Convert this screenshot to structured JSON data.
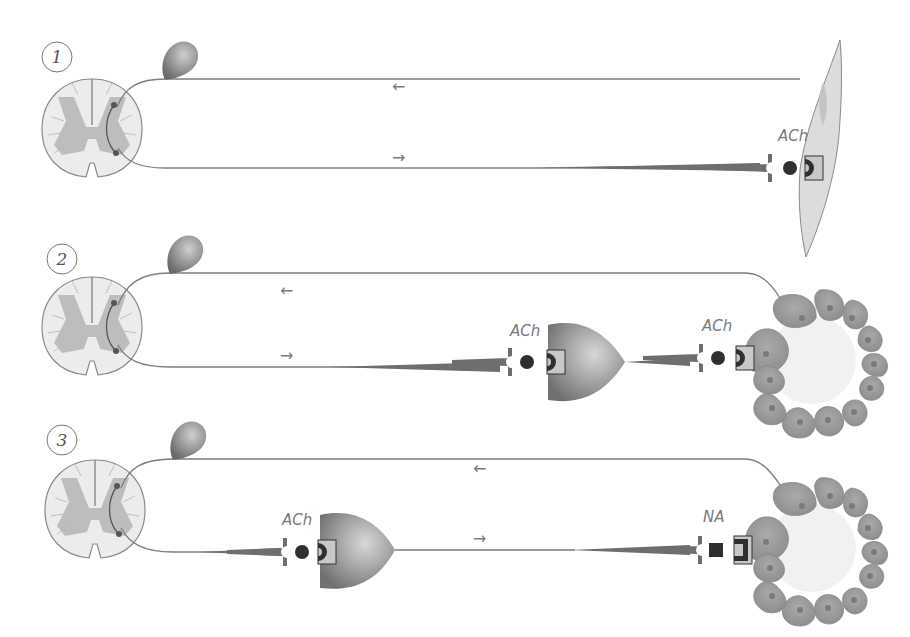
{
  "figure": {
    "panels": [
      {
        "number": "1",
        "afferent_arrow": "←",
        "efferent_arrow": "→",
        "synapses": [
          {
            "transmitter": "ACh",
            "vesicle": "circle"
          }
        ],
        "target": "skeletal-muscle-fiber"
      },
      {
        "number": "2",
        "afferent_arrow": "←",
        "efferent_arrow": "→",
        "synapses": [
          {
            "transmitter": "ACh",
            "vesicle": "circle",
            "location": "ganglion"
          },
          {
            "transmitter": "ACh",
            "vesicle": "circle",
            "location": "gland"
          }
        ],
        "target": "gland-acinus"
      },
      {
        "number": "3",
        "afferent_arrow": "←",
        "efferent_arrow": "→",
        "synapses": [
          {
            "transmitter": "ACh",
            "vesicle": "circle",
            "location": "ganglion"
          },
          {
            "transmitter": "NA",
            "vesicle": "square",
            "location": "gland"
          }
        ],
        "target": "gland-acinus"
      }
    ]
  },
  "colors": {
    "neuron": "#6e6e6e",
    "line": "#7d7d7d",
    "cord_white_matter": "#ececec",
    "cord_grey_matter": "#bdbdbd",
    "muscle": "#dcdcdc",
    "gland_cell": "#9a9a9a",
    "receptor_box": "#c8c8c8",
    "transmitter": "#2f2f2f"
  }
}
